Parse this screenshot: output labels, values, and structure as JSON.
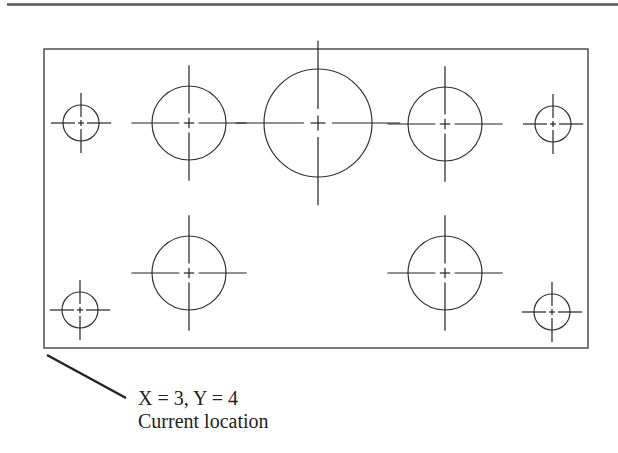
{
  "diagram": {
    "type": "hole-pattern-plate",
    "colors": {
      "line": "#333333",
      "rule": "#555555",
      "background": "#ffffff"
    },
    "plate": {
      "x": 44,
      "y": 49,
      "width": 544,
      "height": 299
    },
    "holes": [
      {
        "id": "small-top-left",
        "cx": 81,
        "cy": 123,
        "r": 18
      },
      {
        "id": "medium-top-left",
        "cx": 189,
        "cy": 123,
        "r": 37
      },
      {
        "id": "large-top-center",
        "cx": 318,
        "cy": 123,
        "r": 54
      },
      {
        "id": "medium-top-right",
        "cx": 445,
        "cy": 124,
        "r": 37
      },
      {
        "id": "small-top-right",
        "cx": 553,
        "cy": 124,
        "r": 18
      },
      {
        "id": "medium-bottom-left",
        "cx": 189,
        "cy": 273,
        "r": 37
      },
      {
        "id": "medium-bottom-right",
        "cx": 445,
        "cy": 273,
        "r": 37
      },
      {
        "id": "small-bottom-left",
        "cx": 80,
        "cy": 310,
        "r": 18
      },
      {
        "id": "small-bottom-right",
        "cx": 552,
        "cy": 312,
        "r": 18
      }
    ],
    "leader": {
      "x1": 47,
      "y1": 355,
      "x2": 126,
      "y2": 398
    },
    "annotation": {
      "coords": "X = 3, Y = 4",
      "caption": "Current location"
    }
  }
}
